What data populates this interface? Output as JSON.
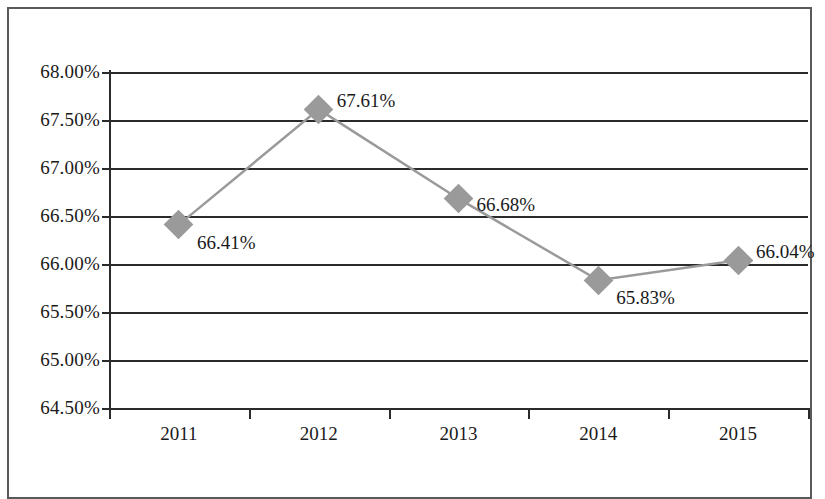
{
  "chart_data": {
    "type": "line",
    "title": "",
    "subtitle": "",
    "xlabel": "",
    "ylabel": "",
    "categories": [
      "2011",
      "2012",
      "2013",
      "2014",
      "2015"
    ],
    "values": [
      66.41,
      67.61,
      66.68,
      65.83,
      66.04
    ],
    "point_labels": [
      "66.41%",
      "67.61%",
      "66.68%",
      "65.83%",
      "66.04%"
    ],
    "series": [
      {
        "name": "",
        "values": [
          66.41,
          67.61,
          66.68,
          65.83,
          66.04
        ]
      }
    ],
    "ylim": [
      64.5,
      68.0
    ],
    "ytick_step": 0.5,
    "ytick_values": [
      64.5,
      65.0,
      65.5,
      66.0,
      66.5,
      67.0,
      67.5,
      68.0
    ],
    "ytick_labels": [
      "64.50%",
      "65.00%",
      "65.50%",
      "66.00%",
      "66.50%",
      "67.00%",
      "67.50%",
      "68.00%"
    ],
    "grid": true,
    "grid_axis": "y",
    "legend": false,
    "legend_position": "none",
    "marker": "diamond",
    "colors": {
      "line": "#9a9a9a",
      "marker": "#9a9a9a",
      "gridline": "#2b2b2b",
      "axis": "#2b2b2b",
      "text": "#1a1a1a",
      "border": "#5a5a5a",
      "background": "#ffffff"
    }
  }
}
